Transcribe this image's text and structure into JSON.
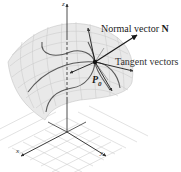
{
  "figure": {
    "type": "surface-normal-diagram",
    "labels": {
      "normal": "Normal vector ",
      "normal_symbol": "N",
      "tangent": "Tangent vectors",
      "point": "P",
      "point_sub": "0",
      "axis_x": "x",
      "axis_y": "y",
      "axis_z": "z"
    },
    "colors": {
      "surface_fill": "#e6e6e6",
      "surface_grid": "#bdbdbd",
      "curves": "#555555",
      "vectors": "#1a1a1a",
      "floor_grid": "#c8c8c8",
      "axes": "#222222"
    }
  }
}
